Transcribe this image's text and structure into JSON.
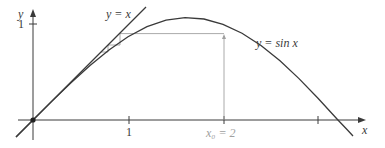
{
  "figure": {
    "axes": {
      "x_label": "x",
      "y_label": "y",
      "x_ticks": [
        {
          "value": 1,
          "label": "1"
        },
        {
          "value": 2,
          "label": "x₀ = 2"
        },
        {
          "value": 3,
          "label": ""
        }
      ],
      "y_ticks": [
        {
          "value": 1,
          "label": "1"
        }
      ]
    },
    "curves": [
      {
        "name": "identity",
        "label": "y = x"
      },
      {
        "name": "sine",
        "label": "y = sin x"
      }
    ],
    "start_point": {
      "label": "x₀ = 2",
      "x": 2,
      "y": 0.909
    },
    "fixed_point": {
      "x": 0,
      "y": 0
    },
    "colors": {
      "curve": "#3a3a3a",
      "axis": "#3a3a3a",
      "construction": "#a0a0a0",
      "x0_label": "#a0a0a0"
    }
  }
}
